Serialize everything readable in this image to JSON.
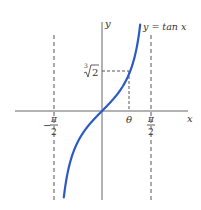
{
  "chart_data": {
    "type": "line",
    "title": "",
    "xlabel": "x",
    "ylabel": "y",
    "series": [
      {
        "name": "y = tan x",
        "function": "tan(x)",
        "color": "#2a5bc4",
        "x": [
          -1.35,
          -1.2,
          -1.0,
          -0.8,
          -0.6,
          -0.4,
          -0.2,
          0,
          0.2,
          0.4,
          0.6,
          0.8,
          0.9,
          1.0,
          1.2,
          1.35
        ],
        "y": [
          -4.45,
          -2.57,
          -1.56,
          -1.03,
          -0.68,
          -0.42,
          -0.2,
          0,
          0.2,
          0.42,
          0.68,
          1.03,
          1.26,
          1.56,
          2.57,
          4.45
        ]
      }
    ],
    "asymptotes": [
      {
        "x_label_num": "π",
        "x_label_den": "2",
        "sign": "−",
        "value": -1.5708
      },
      {
        "x_label_num": "π",
        "x_label_den": "2",
        "sign": "",
        "value": 1.5708
      }
    ],
    "annotations": {
      "curve_label": "y = tan x",
      "y_axis_label": "y",
      "x_axis_label": "x",
      "theta_label": "θ",
      "theta_value_label": "∛2",
      "theta_value_index": "3",
      "theta_value_radicand": "2",
      "theta_x": 0.9,
      "theta_y": 1.26
    },
    "grid": false,
    "legend": false
  },
  "labels": {
    "y_axis": "y",
    "x_axis": "x",
    "curve": "y = tan x",
    "theta": "θ",
    "cuberoot_index": "3",
    "cuberoot_radicand": "2",
    "neg_sign": "−",
    "pi": "π",
    "two": "2"
  }
}
